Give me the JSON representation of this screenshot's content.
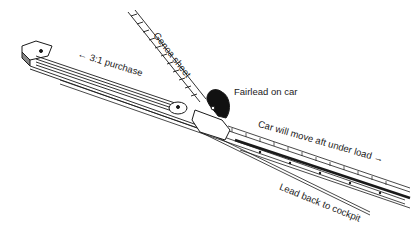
{
  "diagram": {
    "labels": {
      "purchase": "← 3:1 purchase",
      "genoa_sheet": "Genoa sheet",
      "fairlead": "Fairlead on car",
      "car_move": "Car will move aft under load →",
      "lead_back": "Lead back to cockpit"
    },
    "colors": {
      "line": "#1a1a1a",
      "background": "#ffffff"
    }
  }
}
